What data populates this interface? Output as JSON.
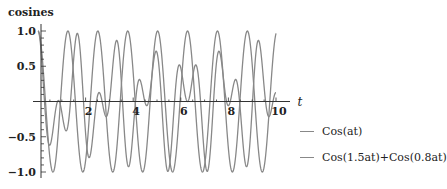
{
  "chart_data": {
    "type": "line",
    "title": "",
    "xlabel": "t",
    "ylabel": "cosines",
    "xlim": [
      0,
      10
    ],
    "ylim": [
      -1.0,
      1.0
    ],
    "x_ticks": [
      2,
      4,
      6,
      8,
      10
    ],
    "y_ticks": [
      -1.0,
      -0.5,
      0.5,
      1.0
    ],
    "y_tick_labels": [
      "−1.0",
      "−0.5",
      "0.5",
      "1.0"
    ],
    "grid": false,
    "legend_position": "right",
    "parameters": {
      "a": 5
    },
    "series": [
      {
        "name": "Cos(at)",
        "expr": "cos(a*t)",
        "color": "#888888"
      },
      {
        "name": "Cos(1.5at)+Cos(0.8at)",
        "expr": "(cos(1.5*a*t)+cos(0.8*a*t))/2",
        "color": "#888888"
      }
    ]
  },
  "axes": {
    "y_label": "cosines",
    "x_label": "t",
    "x_tick_labels": [
      "2",
      "4",
      "6",
      "8",
      "10"
    ],
    "y_tick_labels": [
      "1.0",
      "0.5",
      "−0.5",
      "−1.0"
    ]
  },
  "legend": {
    "items": [
      {
        "label": "Cos(at)"
      },
      {
        "label": "Cos(1.5at)+Cos(0.8at)"
      }
    ]
  }
}
